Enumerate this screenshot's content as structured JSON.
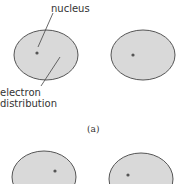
{
  "figure": {
    "labels": {
      "nucleus": "nucleus",
      "electron_line1": "electron",
      "electron_line2": "distribution",
      "panel_a": "(a)"
    },
    "colors": {
      "ellipse_fill": "#d9d9d9",
      "ellipse_stroke": "#555555",
      "nucleus_dot": "#555555",
      "leader_line": "#444444"
    }
  }
}
